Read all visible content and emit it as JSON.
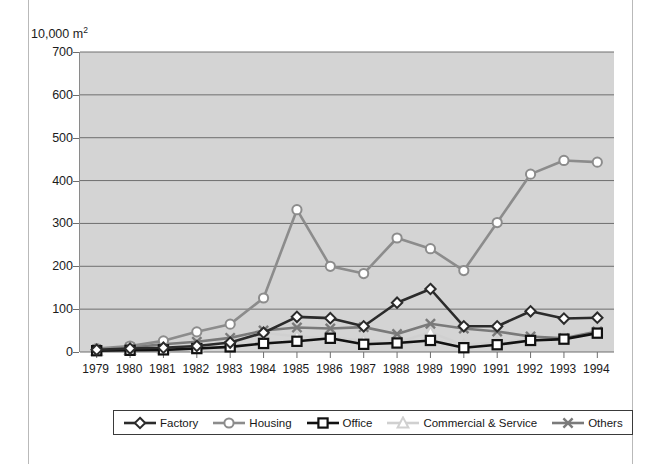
{
  "axis_unit_label": "10,000 m",
  "axis_unit_exponent": "2",
  "legend": {
    "items": [
      {
        "label": "Factory",
        "marker": "diamond-marker-icon",
        "color": "#2b2b2b"
      },
      {
        "label": "Housing",
        "marker": "circle-marker-icon",
        "color": "#8c8c8c"
      },
      {
        "label": "Office",
        "marker": "square-marker-icon",
        "color": "#111111"
      },
      {
        "label": "Commercial & Service",
        "marker": "triangle-marker-icon",
        "color": "#d0d0d0"
      },
      {
        "label": "Others",
        "marker": "cross-marker-icon",
        "color": "#7a7a7a"
      }
    ]
  },
  "chart_data": {
    "type": "line",
    "title": "",
    "xlabel": "",
    "ylabel": "10,000 m2",
    "ylim": [
      0,
      700
    ],
    "yticks": [
      0,
      100,
      200,
      300,
      400,
      500,
      600,
      700
    ],
    "grid": true,
    "legend_position": "bottom",
    "categories": [
      "1979",
      "1980",
      "1981",
      "1982",
      "1983",
      "1984",
      "1985",
      "1986",
      "1987",
      "1988",
      "1989",
      "1990",
      "1991",
      "1992",
      "1993",
      "1994"
    ],
    "series": [
      {
        "name": "Factory",
        "color": "#2b2b2b",
        "marker": "diamond",
        "values": [
          5,
          8,
          10,
          14,
          22,
          45,
          82,
          79,
          60,
          115,
          147,
          60,
          60,
          95,
          78,
          80
        ]
      },
      {
        "name": "Housing",
        "color": "#8c8c8c",
        "marker": "circle",
        "values": [
          8,
          14,
          26,
          47,
          65,
          126,
          332,
          200,
          183,
          266,
          241,
          190,
          302,
          415,
          447,
          443
        ]
      },
      {
        "name": "Office",
        "color": "#111111",
        "marker": "square",
        "values": [
          3,
          4,
          5,
          8,
          12,
          20,
          25,
          32,
          18,
          21,
          27,
          10,
          17,
          27,
          30,
          44
        ]
      },
      {
        "name": "Commercial & Service",
        "color": "#d0d0d0",
        "marker": "triangle",
        "values": [
          4,
          6,
          9,
          13,
          20,
          45,
          36,
          33,
          27,
          22,
          46,
          16,
          22,
          30,
          36,
          50
        ]
      },
      {
        "name": "Others",
        "color": "#7a7a7a",
        "marker": "cross",
        "values": [
          6,
          11,
          18,
          24,
          33,
          50,
          57,
          55,
          58,
          42,
          66,
          55,
          48,
          36,
          32,
          48
        ]
      }
    ]
  }
}
